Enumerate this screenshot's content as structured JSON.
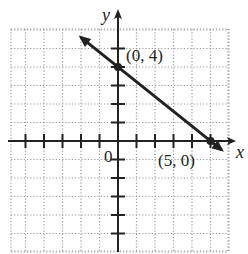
{
  "chart_data": {
    "type": "line",
    "title": "",
    "xlabel": "x",
    "ylabel": "y",
    "xlim": [
      -6,
      6
    ],
    "ylim": [
      -6,
      6
    ],
    "grid": true,
    "grid_style": "dotted",
    "series": [
      {
        "name": "line",
        "equation": "y = -4/5 x + 4",
        "x": [
          -2,
          0,
          5,
          5.6
        ],
        "y": [
          5.6,
          4,
          0,
          -0.48
        ],
        "arrows_both_ends": true
      }
    ],
    "points": [
      {
        "x": 0,
        "y": 4,
        "label": "(0, 4)"
      },
      {
        "x": 5,
        "y": 0,
        "label": "(5, 0)"
      }
    ],
    "origin_label": "0",
    "ticks": {
      "x": [
        -5,
        -4,
        -3,
        -2,
        -1,
        1,
        2,
        3,
        4,
        5
      ],
      "y": [
        -5,
        -4,
        -3,
        -2,
        -1,
        1,
        2,
        3,
        4,
        5
      ],
      "tick_labels_shown": false
    }
  },
  "labels": {
    "x_axis": "x",
    "y_axis": "y",
    "origin": "0",
    "point_a": "(0, 4)",
    "point_b": "(5, 0)"
  },
  "colors": {
    "axis": "#222222",
    "grid": "#9a9a9a",
    "line": "#222222"
  }
}
